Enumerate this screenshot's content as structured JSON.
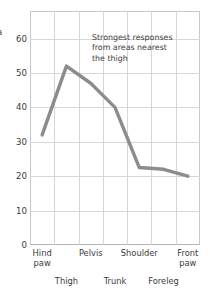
{
  "axis_title_visible_fragment": "a",
  "annotation": {
    "line1": "Strongest responses",
    "line2": "from areas nearest",
    "line3": "the thigh"
  },
  "chart_data": {
    "type": "line",
    "title": "",
    "xlabel": "",
    "ylabel": "a",
    "categories": [
      "Hind paw",
      "Thigh",
      "Pelvis",
      "Trunk",
      "Shoulder",
      "Foreleg",
      "Front paw"
    ],
    "values": [
      32,
      52,
      47,
      40,
      22.5,
      22,
      20
    ],
    "ylim": [
      0,
      68
    ],
    "yticks": [
      0,
      10,
      20,
      30,
      40,
      50,
      60
    ],
    "ytick_labels": [
      "0",
      "10",
      "20",
      "30",
      "40",
      "50",
      "60"
    ],
    "grid": true,
    "legend": "none",
    "line_color": "#8c8c8c",
    "grid_color": "#d7d7d7",
    "frame_color": "#c9c9c9",
    "annotations": [
      {
        "text": "Strongest responses from areas nearest the thigh",
        "anchor_category": "Pelvis"
      }
    ]
  },
  "colors": {
    "line": "#8c8c8c",
    "grid": "#d7d7d7",
    "frame": "#c9c9c9",
    "text": "#3b3b3b",
    "background": "#ffffff"
  },
  "yticks": [
    {
      "label": "60",
      "value": 60
    },
    {
      "label": "50",
      "value": 50
    },
    {
      "label": "40",
      "value": 40
    },
    {
      "label": "30",
      "value": 30
    },
    {
      "label": "20",
      "value": 20
    },
    {
      "label": "10",
      "value": 10
    },
    {
      "label": "0",
      "value": 0
    }
  ],
  "xlabels": [
    {
      "text": "Hind\npaw",
      "row": 1
    },
    {
      "text": "Thigh",
      "row": 2
    },
    {
      "text": "Pelvis",
      "row": 1
    },
    {
      "text": "Trunk",
      "row": 2
    },
    {
      "text": "Shoulder",
      "row": 1
    },
    {
      "text": "Foreleg",
      "row": 2
    },
    {
      "text": "Front\npaw",
      "row": 1
    }
  ]
}
